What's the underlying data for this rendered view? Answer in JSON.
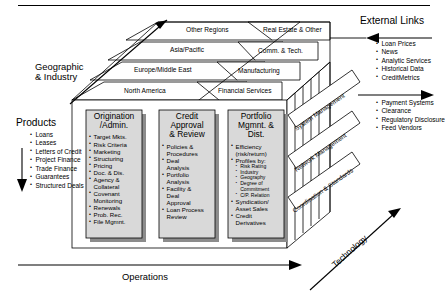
{
  "figure": {
    "top_rule": true,
    "bottom_axis_label": "Operations",
    "right_axis_label": "Technology",
    "left_axis_label_line1": "Geographic",
    "left_axis_label_line2": "& Industry"
  },
  "geography_slabs": [
    "Other Regions",
    "Asia/Pacific",
    "Europe/Middle East",
    "North America"
  ],
  "industry_slabs": [
    "Real Estate & Other",
    "Comm. & Tech.",
    "Manufacturing",
    "Financial Services"
  ],
  "products": {
    "title": "Products",
    "items": [
      "Loans",
      "Leases",
      "Letters of Credit",
      "Project Finance",
      "Trade Finance",
      "Guarantees",
      "Structured Deals"
    ]
  },
  "external_links": {
    "title": "External Links",
    "items": [
      "Loan Prices",
      "News",
      "Analytic Services",
      "Historical Data",
      "CreditMetrics"
    ]
  },
  "outbound_links": {
    "items": [
      "Payment Systems",
      "Clearance",
      "Regulatory Disclosure",
      "Feed Vendors"
    ]
  },
  "panels": [
    {
      "title_line1": "Origination",
      "title_line2": "/Admin.",
      "items": [
        {
          "text": "Target Mkts.",
          "level": 1
        },
        {
          "text": "Risk Criteria",
          "level": 1
        },
        {
          "text": "Marketing",
          "level": 1
        },
        {
          "text": "Structuring",
          "level": 1
        },
        {
          "text": "Pricing",
          "level": 1
        },
        {
          "text": "Doc. & Dis.",
          "level": 1
        },
        {
          "text": "Agency &",
          "level": 1
        },
        {
          "text": "Collateral",
          "level": 0
        },
        {
          "text": "Covenant",
          "level": 1
        },
        {
          "text": "Monitoring",
          "level": 0
        },
        {
          "text": "Renewals",
          "level": 1
        },
        {
          "text": "Prob. Rec.",
          "level": 1
        },
        {
          "text": "File Mgmnt.",
          "level": 1
        }
      ]
    },
    {
      "title_line1": "Credit",
      "title_line2": "Approval",
      "title_line3": "& Review",
      "items": [
        {
          "text": "Policies &",
          "level": 1
        },
        {
          "text": "Procedures",
          "level": 0
        },
        {
          "text": "Deal",
          "level": 1
        },
        {
          "text": "Analysis",
          "level": 0
        },
        {
          "text": "Portfolio",
          "level": 1
        },
        {
          "text": "Analysis",
          "level": 0
        },
        {
          "text": "Facility &",
          "level": 1
        },
        {
          "text": "Deal",
          "level": 0
        },
        {
          "text": "Approval",
          "level": 0
        },
        {
          "text": "Loan Process",
          "level": 1
        },
        {
          "text": "Review",
          "level": 0
        }
      ]
    },
    {
      "title_line1": "Portfolio",
      "title_line2": "Mgmnt. &",
      "title_line3": "Dist.",
      "items": [
        {
          "text": "Efficiency",
          "level": 1
        },
        {
          "text": "(risk/return)",
          "level": 0
        },
        {
          "text": "Profiles by:",
          "level": 1
        },
        {
          "text": "Risk Rating",
          "level": 2
        },
        {
          "text": "Industry",
          "level": 2
        },
        {
          "text": "Geography",
          "level": 2
        },
        {
          "text": "Degree of",
          "level": 2
        },
        {
          "text": "Commitment",
          "level": 3
        },
        {
          "text": "C/P. Relation",
          "level": 2
        },
        {
          "text": "Syndication/",
          "level": 1
        },
        {
          "text": "Asset Sales",
          "level": 0
        },
        {
          "text": "Credit",
          "level": 1
        },
        {
          "text": "Derivatives",
          "level": 0
        }
      ]
    }
  ],
  "diagonal_layers": [
    "System Management",
    "Network Management",
    "Coordination & Standards"
  ],
  "colors": {
    "ink": "#000000",
    "panel_fill": "#d9d9d9",
    "slab_fill": "#ffffff",
    "shadow": "#8c8c8c",
    "band_fill": "#ffffff"
  }
}
